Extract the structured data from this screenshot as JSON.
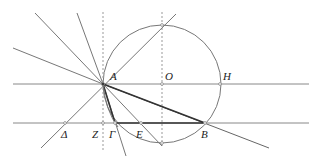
{
  "diagram": {
    "type": "geometric-construction",
    "colors": {
      "line": "#777777",
      "bold": "#333333",
      "dashed": "#999999",
      "point": "#ffffff"
    },
    "points": {
      "A": {
        "label": "A",
        "x": 103,
        "y": 84
      },
      "O": {
        "label": "O",
        "x": 162,
        "y": 84
      },
      "H": {
        "label": "H",
        "x": 220,
        "y": 84
      },
      "Delta": {
        "label": "Δ",
        "x": 65,
        "y": 123
      },
      "Z": {
        "label": "Z",
        "x": 103,
        "y": 123
      },
      "Gamma": {
        "label": "Γ",
        "x": 115,
        "y": 123
      },
      "E": {
        "label": "E",
        "x": 141,
        "y": 123
      },
      "B": {
        "label": "B",
        "x": 205,
        "y": 123
      }
    },
    "circle": {
      "center": "O",
      "radius": 59
    }
  }
}
